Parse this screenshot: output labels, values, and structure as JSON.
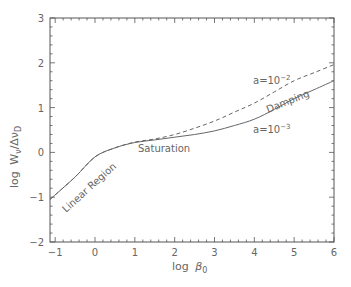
{
  "chart_data": {
    "type": "line",
    "title": "",
    "xlabel": "log β_0",
    "ylabel": "log W_ν/Δν_D",
    "xlim": [
      -1.13,
      6
    ],
    "ylim": [
      -2,
      3
    ],
    "grid": false,
    "x_ticks": [
      "-1",
      "0",
      "1",
      "2",
      "3",
      "4",
      "5",
      "6"
    ],
    "y_ticks": [
      "-2",
      "-1",
      "0",
      "1",
      "2",
      "3"
    ],
    "series": [
      {
        "name": "a=10^-3",
        "style": "solid",
        "x": [
          -1.13,
          -0.5,
          0,
          0.5,
          1,
          1.5,
          2,
          2.5,
          3,
          3.5,
          4,
          4.5,
          5,
          5.5,
          6
        ],
        "y": [
          -1.05,
          -0.55,
          -0.1,
          0.1,
          0.22,
          0.28,
          0.34,
          0.4,
          0.48,
          0.6,
          0.74,
          0.96,
          1.2,
          1.4,
          1.6
        ]
      },
      {
        "name": "a=10^-2",
        "style": "dashed",
        "x": [
          -1.13,
          -0.5,
          0,
          0.5,
          1,
          1.5,
          2,
          2.5,
          3,
          3.5,
          4,
          4.5,
          5,
          5.5,
          6
        ],
        "y": [
          -1.05,
          -0.55,
          -0.1,
          0.1,
          0.23,
          0.3,
          0.4,
          0.54,
          0.7,
          0.9,
          1.1,
          1.35,
          1.6,
          1.78,
          1.96
        ]
      }
    ],
    "annotations": [
      {
        "text": "Linear Region",
        "x": -0.6,
        "y": -0.65,
        "rotation": -42
      },
      {
        "text": "Saturation",
        "x": 1.55,
        "y": 0.05
      },
      {
        "text": "Damping",
        "x": 4.8,
        "y": 1.05,
        "rotation": -20
      },
      {
        "text": "a=10^-2",
        "x": 4.3,
        "y": 1.58
      },
      {
        "text": "a=10^-3",
        "x": 4.3,
        "y": 0.48
      }
    ]
  },
  "labels": {
    "xlabel_main": "log",
    "xlabel_sym": "β",
    "xlabel_sub": "0",
    "ylabel_main": "log",
    "ylabel_w": "W",
    "ylabel_w_sub": "ν",
    "ylabel_slash": "/Δν",
    "ylabel_sub": "D",
    "anno_linear": "Linear Region",
    "anno_saturation": "Saturation",
    "anno_damping": "Damping",
    "anno_a2_base": "a=10",
    "anno_a2_exp": "−2",
    "anno_a3_base": "a=10",
    "anno_a3_exp": "−3"
  }
}
